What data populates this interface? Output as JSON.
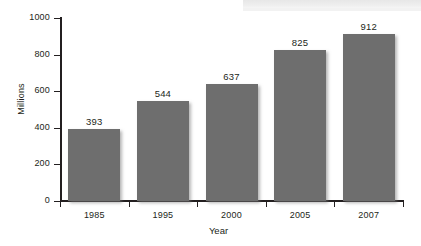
{
  "chart_data": {
    "type": "bar",
    "title": "",
    "subtitle": "",
    "xlabel": "Year",
    "ylabel": "Millions",
    "categories": [
      "1985",
      "1995",
      "2000",
      "2005",
      "2007"
    ],
    "values": [
      393,
      544,
      637,
      825,
      912
    ],
    "series": [
      {
        "name": "Millions",
        "values": [
          393,
          544,
          637,
          825,
          912
        ]
      }
    ],
    "ylim": [
      0,
      1000
    ],
    "y_ticks": [
      0,
      200,
      400,
      600,
      800,
      1000
    ],
    "y_tick_labels": [
      "0",
      "200",
      "400",
      "600",
      "800",
      "1000"
    ],
    "data_labels": [
      "393",
      "544",
      "637",
      "825",
      "912"
    ],
    "grid": false,
    "legend": false,
    "legend_position": "none",
    "bar_color": "#6e6e6e",
    "axis_color": "#231f20",
    "text_color": "#231f20",
    "background_color": "#ffffff"
  }
}
